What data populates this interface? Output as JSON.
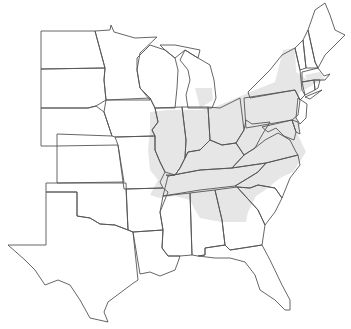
{
  "map": {
    "title": "",
    "region": "Eastern United States",
    "colors": {
      "background": "#ffffff",
      "shaded_range": "#e6e6e6",
      "border": "#555555"
    },
    "shaded_states": [
      "Illinois (east/central)",
      "Indiana",
      "Ohio",
      "Michigan (lower, south)",
      "Kentucky",
      "Tennessee",
      "West Virginia",
      "Virginia",
      "North Carolina",
      "South Carolina",
      "Georgia (north)",
      "Alabama (north)",
      "Pennsylvania",
      "New York",
      "New Jersey",
      "Maryland",
      "Delaware",
      "Massachusetts",
      "Connecticut",
      "Rhode Island",
      "Missouri (eastern edge)"
    ],
    "unshaded_states": [
      "North Dakota",
      "South Dakota",
      "Nebraska",
      "Kansas",
      "Oklahoma",
      "Texas",
      "Minnesota",
      "Iowa",
      "Wisconsin",
      "Arkansas",
      "Louisiana",
      "Mississippi",
      "Florida",
      "Maine",
      "New Hampshire",
      "Vermont"
    ]
  }
}
